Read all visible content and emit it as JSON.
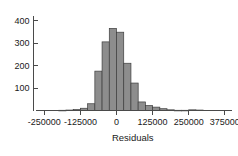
{
  "chart_data": {
    "type": "bar",
    "title": "",
    "subtitle": "",
    "xlabel": "Residuals",
    "ylabel": "",
    "legend": [],
    "grid": false,
    "xlim": [
      -287500,
      400000
    ],
    "ylim": [
      0,
      420
    ],
    "bin_width": 25000,
    "xticks": [
      -250000,
      -125000,
      0,
      125000,
      250000,
      375000
    ],
    "xticklabels": [
      "-250000",
      "-125000",
      "0",
      "125000",
      "250000",
      "375000"
    ],
    "yticks": [
      100,
      200,
      300,
      400
    ],
    "yticklabels": [
      "100",
      "200",
      "300",
      "400"
    ],
    "bin_centers": [
      -262500,
      -237500,
      -212500,
      -187500,
      -162500,
      -137500,
      -112500,
      -87500,
      -62500,
      -37500,
      -12500,
      12500,
      37500,
      62500,
      87500,
      112500,
      137500,
      162500,
      187500,
      212500,
      237500,
      262500,
      287500,
      312500,
      337500,
      362500,
      387500
    ],
    "categories": [
      "-262500",
      "-237500",
      "-212500",
      "-187500",
      "-162500",
      "-137500",
      "-112500",
      "-87500",
      "-62500",
      "-37500",
      "-12500",
      "12500",
      "37500",
      "62500",
      "87500",
      "112500",
      "137500",
      "162500",
      "187500",
      "212500",
      "237500",
      "262500",
      "287500",
      "312500",
      "337500",
      "362500",
      "387500"
    ],
    "values": [
      0,
      0,
      0,
      1,
      2,
      4,
      10,
      30,
      175,
      305,
      365,
      348,
      210,
      122,
      38,
      22,
      15,
      8,
      3,
      1,
      1,
      3,
      2,
      0,
      0,
      0,
      0
    ],
    "bar_color": "#8d8d8d",
    "bar_edge_color": "#3d3d3d",
    "axis_color": "#4a4a4a",
    "background_color": "#ffffff"
  }
}
